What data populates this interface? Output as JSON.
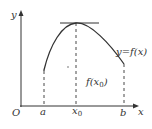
{
  "diagram": {
    "axes": {
      "x_label": "x",
      "y_label": "y",
      "origin_label": "O"
    },
    "ticks": {
      "a": "a",
      "x0": "x",
      "x0_sub": "0",
      "b": "b"
    },
    "curve_label": "y=f(x)",
    "value_label": {
      "prefix": "f(x",
      "sub": "0",
      "suffix": ")"
    },
    "colors": {
      "line": "#333333",
      "background": "#ffffff"
    }
  }
}
